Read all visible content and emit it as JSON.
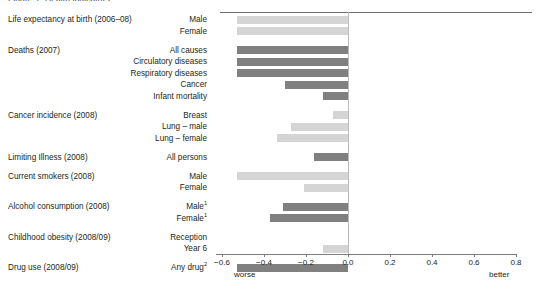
{
  "figure": {
    "top_fragment": "Figure 1: Health indicators",
    "axis": {
      "ticks": [
        -0.6,
        -0.4,
        -0.2,
        0.0,
        0.2,
        0.4,
        0.6,
        0.8
      ],
      "tick_labels": [
        "−0.6",
        "−0.4",
        "−0.2",
        "0.0",
        "0.2",
        "0.4",
        "0.6",
        "0.8"
      ],
      "left_note": "worse",
      "right_note": "better",
      "xmin": -0.6,
      "xmax": 0.8
    },
    "colors": {
      "light_bar": "#d5d5d5",
      "dark_bar": "#808080",
      "zero_line": "#bcbcbc",
      "axis_line": "#7d7d7d",
      "top_rule": "#6e6e6e",
      "text": "#231f20"
    }
  },
  "chart_data": {
    "type": "bar",
    "orientation": "horizontal",
    "title": "",
    "xlabel": "",
    "ylabel": "",
    "xlim": [
      -0.6,
      0.8
    ],
    "grid": false,
    "legend": "none",
    "annotations": [
      "worse",
      "better"
    ],
    "groups": [
      {
        "name": "Life expectancy at birth (2006–08)",
        "rows": [
          {
            "label": "Male",
            "value": -0.53,
            "shade": "light"
          },
          {
            "label": "Female",
            "value": -0.53,
            "shade": "light"
          }
        ]
      },
      {
        "name": "Deaths (2007)",
        "rows": [
          {
            "label": "All causes",
            "value": -0.53,
            "shade": "dark"
          },
          {
            "label": "Circulatory diseases",
            "value": -0.53,
            "shade": "dark"
          },
          {
            "label": "Respiratory diseases",
            "value": -0.53,
            "shade": "dark"
          },
          {
            "label": "Cancer",
            "value": -0.3,
            "shade": "dark"
          },
          {
            "label": "Infant mortality",
            "value": -0.12,
            "shade": "dark"
          }
        ]
      },
      {
        "name": "Cancer incidence (2008)",
        "rows": [
          {
            "label": "Breast",
            "value": -0.07,
            "shade": "light"
          },
          {
            "label": "Lung – male",
            "value": -0.27,
            "shade": "light"
          },
          {
            "label": "Lung – female",
            "value": -0.34,
            "shade": "light"
          }
        ]
      },
      {
        "name": "Limiting Illness (2008)",
        "rows": [
          {
            "label": "All persons",
            "value": -0.16,
            "shade": "dark"
          }
        ]
      },
      {
        "name": "Current smokers (2008)",
        "rows": [
          {
            "label": "Male",
            "value": -0.53,
            "shade": "light"
          },
          {
            "label": "Female",
            "value": -0.21,
            "shade": "light"
          }
        ]
      },
      {
        "name": "Alcohol consumption (2008)",
        "rows": [
          {
            "label": "Male",
            "sup": "1",
            "value": -0.31,
            "shade": "dark"
          },
          {
            "label": "Female",
            "sup": "1",
            "value": -0.37,
            "shade": "dark"
          }
        ]
      },
      {
        "name": "Childhood obesity (2008/09)",
        "rows": [
          {
            "label": "Reception",
            "value": 0.0,
            "shade": "light"
          },
          {
            "label": "Year 6",
            "value": -0.12,
            "shade": "light"
          }
        ]
      },
      {
        "name": "Drug use (2008/09)",
        "rows": [
          {
            "label": "Any drug",
            "sup": "2",
            "value": -0.53,
            "shade": "dark"
          }
        ]
      }
    ]
  }
}
